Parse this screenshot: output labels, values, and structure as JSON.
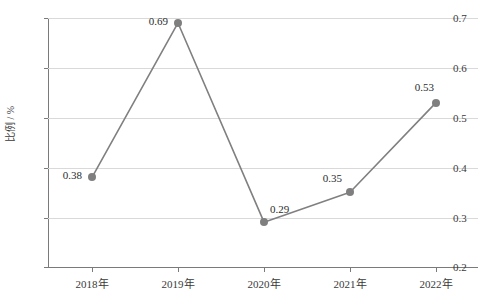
{
  "chart_data": {
    "type": "line",
    "title": "",
    "xlabel": "",
    "ylabel": "比例 / %",
    "categories": [
      "2018年",
      "2019年",
      "2020年",
      "2021年",
      "2022年"
    ],
    "values": [
      0.38,
      0.69,
      0.29,
      0.35,
      0.53
    ],
    "point_labels": [
      "0.38",
      "0.69",
      "0.29",
      "0.35",
      "0.53"
    ],
    "ylim": [
      0.2,
      0.7
    ],
    "yticks": [
      0.2,
      0.3,
      0.4,
      0.5,
      0.6,
      0.7
    ],
    "ytick_labels": [
      "0.2",
      "0.3",
      "0.4",
      "0.5",
      "0.6",
      "0.7"
    ],
    "grid": true,
    "legend": "none",
    "series": [
      {
        "name": "比例",
        "values": [
          0.38,
          0.69,
          0.29,
          0.35,
          0.53
        ],
        "line_color": "#808080",
        "marker_color": "#7f7f7f",
        "marker": "circle"
      }
    ],
    "colors": {
      "line": "#808080",
      "marker": "#7f7f7f",
      "grid": "#d9d9d9",
      "axis": "#7a7a7a",
      "text": "#2b2b2b",
      "background": "#ffffff"
    }
  }
}
